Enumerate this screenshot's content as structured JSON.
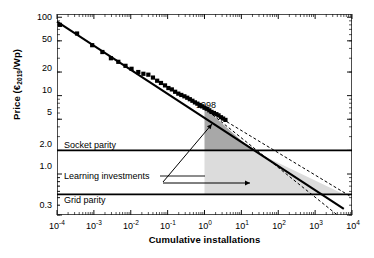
{
  "chart_data": {
    "type": "scatter",
    "title": "",
    "xlabel": "Cumulative installations",
    "ylabel": "Price (€2019/Wp)",
    "ylabel_main": "Price (€",
    "ylabel_sub": "2019",
    "ylabel_tail": "/Wp)",
    "xscale": "log",
    "yscale": "log",
    "xlim": [
      0.0001,
      10000
    ],
    "ylim": [
      0.3,
      110
    ],
    "grid": false,
    "legend": "none",
    "xticks": [
      {
        "value": 0.0001,
        "base": "10",
        "exp": "-4"
      },
      {
        "value": 0.001,
        "base": "10",
        "exp": "-3"
      },
      {
        "value": 0.01,
        "base": "10",
        "exp": "-2"
      },
      {
        "value": 0.1,
        "base": "10",
        "exp": "-1"
      },
      {
        "value": 1,
        "base": "10",
        "exp": "0"
      },
      {
        "value": 10,
        "base": "10",
        "exp": "1"
      },
      {
        "value": 100,
        "base": "10",
        "exp": "2"
      },
      {
        "value": 1000,
        "base": "10",
        "exp": "3"
      },
      {
        "value": 10000,
        "base": "10",
        "exp": "4"
      }
    ],
    "yticks": [
      {
        "value": 100,
        "label": "100"
      },
      {
        "value": 50,
        "label": "50"
      },
      {
        "value": 20,
        "label": "20"
      },
      {
        "value": 10,
        "label": "10"
      },
      {
        "value": 5,
        "label": "5"
      },
      {
        "value": 2.0,
        "label": "2.0"
      },
      {
        "value": 1.0,
        "label": "1.0"
      },
      {
        "value": 0.3,
        "label": "0.3"
      }
    ],
    "series": [
      {
        "name": "Historical module price observations",
        "marker": "filled-square",
        "color": "#000000",
        "points": [
          [
            0.00012,
            80
          ],
          [
            0.00035,
            62
          ],
          [
            0.0009,
            44
          ],
          [
            0.0017,
            36
          ],
          [
            0.0029,
            30
          ],
          [
            0.0046,
            27
          ],
          [
            0.0072,
            24
          ],
          [
            0.0105,
            22
          ],
          [
            0.016,
            20
          ],
          [
            0.022,
            19
          ],
          [
            0.03,
            18.5
          ],
          [
            0.04,
            17
          ],
          [
            0.052,
            15.5
          ],
          [
            0.066,
            14.5
          ],
          [
            0.085,
            13.5
          ],
          [
            0.105,
            12.5
          ],
          [
            0.13,
            12
          ],
          [
            0.16,
            11.2
          ],
          [
            0.195,
            10.6
          ],
          [
            0.235,
            10.2
          ],
          [
            0.285,
            9.8
          ],
          [
            0.34,
            9.4
          ],
          [
            0.4,
            9.0
          ],
          [
            0.47,
            8.6
          ],
          [
            0.55,
            8.2
          ],
          [
            0.64,
            7.9
          ],
          [
            0.74,
            7.6
          ],
          [
            0.86,
            7.3
          ],
          [
            1.0,
            7.0
          ],
          [
            1.15,
            6.8
          ],
          [
            1.35,
            6.5
          ],
          [
            1.55,
            6.2
          ],
          [
            1.8,
            6.0
          ],
          [
            2.1,
            5.8
          ],
          [
            2.4,
            5.6
          ],
          [
            2.8,
            5.3
          ],
          [
            3.2,
            5.1
          ],
          [
            3.7,
            4.9
          ]
        ]
      },
      {
        "name": "Learning curve fit (central)",
        "style": "solid",
        "color": "#000000",
        "endpoints": [
          [
            0.0001,
            88
          ],
          [
            6000,
            0.36
          ]
        ]
      },
      {
        "name": "Learning curve fit (upper bound)",
        "style": "dashed",
        "color": "#000000",
        "endpoints": [
          [
            1.0,
            6.9
          ],
          [
            9000,
            0.52
          ]
        ]
      },
      {
        "name": "Learning curve fit (lower bound)",
        "style": "dashed",
        "color": "#000000",
        "endpoints": [
          [
            1.0,
            6.9
          ],
          [
            4000,
            0.3
          ]
        ]
      }
    ],
    "reference_lines": [
      {
        "name": "Socket parity",
        "label": "Socket parity",
        "y": 2.0,
        "style": "solid",
        "color": "#000000"
      },
      {
        "name": "Grid parity",
        "label": "Grid parity",
        "y": 0.55,
        "style": "solid",
        "color": "#000000"
      }
    ],
    "shaded_regions": [
      {
        "name": "learning-investments-above-socket",
        "fill": "#a8a8a8",
        "x_range": [
          1,
          20
        ],
        "y_range": [
          2.0,
          7.0
        ]
      },
      {
        "name": "learning-investments-below-socket",
        "fill": "#dcdcdc",
        "x_range": [
          1,
          6000
        ],
        "y_range": [
          0.55,
          2.0
        ]
      }
    ],
    "annotations": [
      {
        "name": "year-marker",
        "text": "1998",
        "x": 1.0,
        "y": 7.0
      },
      {
        "name": "socket-parity-label",
        "text": "Socket parity"
      },
      {
        "name": "grid-parity-label",
        "text": "Grid parity"
      },
      {
        "name": "learning-investments-label",
        "text": "Learning investments"
      }
    ]
  },
  "axis": {
    "x_title": "Cumulative installations",
    "y_title_main": "Price (€",
    "y_title_sub": "2019",
    "y_title_tail": "/Wp)"
  },
  "labels": {
    "socket_parity": "Socket parity",
    "grid_parity": "Grid parity",
    "learning_investments": "Learning investments",
    "year": "1998"
  }
}
